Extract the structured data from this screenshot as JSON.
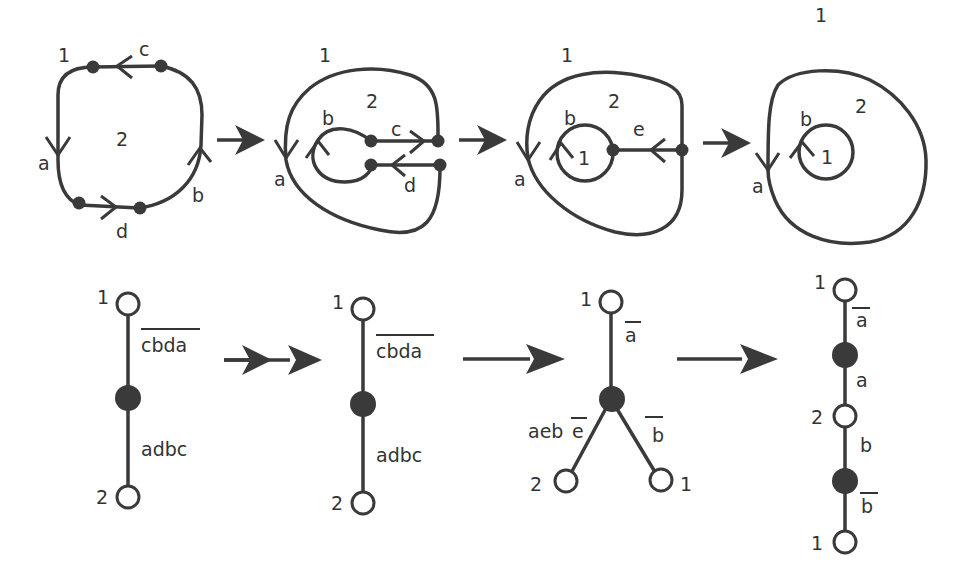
{
  "diagram": {
    "type": "map-to-graph transformation sequence",
    "top_row": {
      "panels": [
        {
          "id": "p1",
          "face_labels": [
            "1",
            "2"
          ],
          "edge_labels": [
            "a",
            "b",
            "c",
            "d"
          ]
        },
        {
          "id": "p2",
          "face_labels": [
            "1",
            "2"
          ],
          "edge_labels": [
            "a",
            "b",
            "c",
            "d"
          ]
        },
        {
          "id": "p3",
          "face_labels": [
            "1",
            "2",
            "1"
          ],
          "edge_labels": [
            "a",
            "b",
            "e"
          ]
        },
        {
          "id": "p4",
          "face_labels": [
            "1",
            "2",
            "1"
          ],
          "edge_labels": [
            "a",
            "b"
          ]
        }
      ]
    },
    "bottom_row": {
      "graphs": [
        {
          "id": "g1",
          "nodes": [
            {
              "label": "1",
              "kind": "open"
            },
            {
              "label": "",
              "kind": "filled"
            },
            {
              "label": "2",
              "kind": "open"
            }
          ],
          "edges": [
            {
              "label": "cbda",
              "overline": true
            },
            {
              "label": "adbc",
              "overline": false
            }
          ]
        },
        {
          "id": "g2",
          "nodes": [
            {
              "label": "1",
              "kind": "open"
            },
            {
              "label": "",
              "kind": "filled"
            },
            {
              "label": "2",
              "kind": "open"
            }
          ],
          "edges": [
            {
              "label": "cbda",
              "overline": true
            },
            {
              "label": "adbc",
              "overline": false
            }
          ]
        },
        {
          "id": "g3",
          "nodes": [
            {
              "label": "1",
              "kind": "open"
            },
            {
              "label": "",
              "kind": "filled"
            },
            {
              "label": "2",
              "kind": "open"
            },
            {
              "label": "1",
              "kind": "open"
            }
          ],
          "edges": [
            {
              "label": "a",
              "overline": true
            },
            {
              "label_plain": "aeb",
              "label_over": "e"
            },
            {
              "label": "b",
              "overline": true
            }
          ]
        },
        {
          "id": "g4",
          "nodes": [
            {
              "label": "1",
              "kind": "open"
            },
            {
              "label": "",
              "kind": "filled"
            },
            {
              "label": "2",
              "kind": "open"
            },
            {
              "label": "",
              "kind": "filled"
            },
            {
              "label": "1",
              "kind": "open"
            }
          ],
          "edges": [
            {
              "label": "a",
              "overline": true
            },
            {
              "label": "a",
              "overline": false
            },
            {
              "label": "b",
              "overline": false
            },
            {
              "label": "b",
              "overline": true
            }
          ]
        }
      ]
    },
    "arrows": {
      "count": 6,
      "glyph": "right-arrow"
    },
    "colors": {
      "stroke": "#3a3a3a",
      "text": "#333333",
      "background": "#ffffff"
    }
  }
}
